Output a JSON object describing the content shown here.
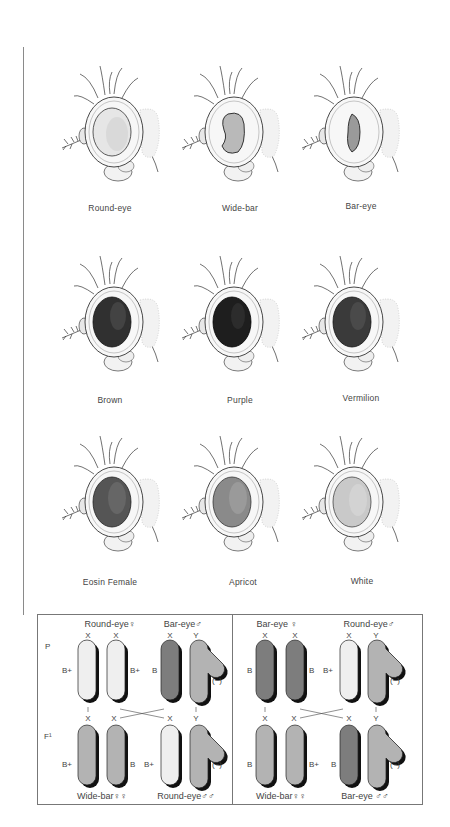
{
  "figure": {
    "colors": {
      "eye_round": "#e6e6e6",
      "eye_dark": "#2a2a2a",
      "eye_brown": "#303030",
      "eye_purple": "#1e1e1e",
      "eye_vermilion": "#3a3a3a",
      "eye_eosin": "#555555",
      "eye_apricot": "#8a8a8a",
      "eye_white": "#c9c9c9",
      "chromosome_bar": "#7d7d7d",
      "chromosome_wide": "#b3b3b3",
      "chromosome_round": "#efefef",
      "chromosome_shadow": "#111111",
      "box_border": "#777777"
    },
    "flies": [
      {
        "label": "Round-eye",
        "eye_shape": "oval",
        "eye_tone": "light"
      },
      {
        "label": "Wide-bar",
        "eye_shape": "kidney",
        "eye_tone": "light"
      },
      {
        "label": "Bar-eye",
        "eye_shape": "narrow-bar",
        "eye_tone": "light"
      },
      {
        "label": "Brown",
        "eye_shape": "oval",
        "eye_tone": "dark"
      },
      {
        "label": "Purple",
        "eye_shape": "oval",
        "eye_tone": "darkest"
      },
      {
        "label": "Vermilion",
        "eye_shape": "oval",
        "eye_tone": "dark"
      },
      {
        "label": "Eosin Female",
        "eye_shape": "oval",
        "eye_tone": "medium-dark"
      },
      {
        "label": "Apricot",
        "eye_shape": "oval",
        "eye_tone": "medium"
      },
      {
        "label": "White",
        "eye_shape": "oval",
        "eye_tone": "pale"
      }
    ]
  },
  "cross_diagram": {
    "left": {
      "generation_p": "P",
      "generation_f1": "F¹",
      "parent_female": "Round-eye♀",
      "parent_male": "Bar-eye♂",
      "offspring_female": "Wide-bar♀♀",
      "offspring_male": "Round-eye♂♂",
      "p_chromosomes": [
        {
          "top": "X",
          "bottom": "X",
          "allele": "B+",
          "allele_side": "left",
          "tone": "round"
        },
        {
          "top": "X",
          "bottom": "X",
          "allele": "B+",
          "allele_side": "right",
          "tone": "round"
        },
        {
          "top": "X",
          "bottom": "X",
          "allele": "B",
          "allele_side": "left",
          "tone": "bar"
        },
        {
          "top": "Y",
          "bottom": "Y",
          "allele": "(−)",
          "allele_side": "right",
          "tone": "wide",
          "is_y": true
        }
      ],
      "f1_chromosomes": [
        {
          "top": "X",
          "allele": "B+",
          "allele_side": "left",
          "tone": "wide"
        },
        {
          "top": "X",
          "allele": "B",
          "allele_side": "right",
          "tone": "wide"
        },
        {
          "top": "X",
          "allele": "B+",
          "allele_side": "left",
          "tone": "round"
        },
        {
          "top": "Y",
          "allele": "(−)",
          "allele_side": "right",
          "tone": "wide",
          "is_y": true
        }
      ]
    },
    "right": {
      "parent_female": "Bar-eye ♀",
      "parent_male": "Round-eye♂",
      "offspring_female": "Wide-bar♀♀",
      "offspring_male": "Bar-eye ♂♂",
      "p_chromosomes": [
        {
          "top": "X",
          "bottom": "X",
          "allele": "B",
          "allele_side": "left",
          "tone": "bar"
        },
        {
          "top": "X",
          "bottom": "X",
          "allele": "B",
          "allele_side": "right",
          "tone": "bar"
        },
        {
          "top": "X",
          "bottom": "X",
          "allele": "B+",
          "allele_side": "left",
          "tone": "round"
        },
        {
          "top": "Y",
          "bottom": "Y",
          "allele": "(−)",
          "allele_side": "right",
          "tone": "wide",
          "is_y": true
        }
      ],
      "f1_chromosomes": [
        {
          "top": "X",
          "allele": "B",
          "allele_side": "left",
          "tone": "wide"
        },
        {
          "top": "X",
          "allele": "B+",
          "allele_side": "right",
          "tone": "wide"
        },
        {
          "top": "X",
          "allele": "B",
          "allele_side": "left",
          "tone": "bar"
        },
        {
          "top": "Y",
          "allele": "(−)",
          "allele_side": "right",
          "tone": "wide",
          "is_y": true
        }
      ]
    }
  }
}
